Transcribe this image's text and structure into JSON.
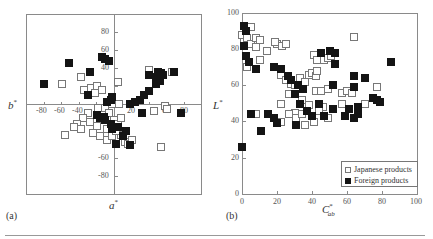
{
  "chart_data": [
    {
      "id": "a",
      "type": "scatter",
      "panel_label": "(a)",
      "title": "",
      "xlabel": "a*",
      "ylabel": "b*",
      "xlim": [
        -100,
        100
      ],
      "ylim": [
        -100,
        100
      ],
      "x_ticks": [
        -80,
        -60,
        -40,
        20,
        60,
        80
      ],
      "y_ticks": [
        80,
        60,
        40,
        -60,
        -80
      ],
      "axes_through_origin": true,
      "grid": false,
      "series": [
        {
          "name": "Japanese products",
          "marker": "open-square",
          "points": [
            [
              -60,
              22
            ],
            [
              -38,
              30
            ],
            [
              -34,
              16
            ],
            [
              -26,
              18
            ],
            [
              -20,
              20
            ],
            [
              -22,
              12
            ],
            [
              -14,
              16
            ],
            [
              4,
              24
            ],
            [
              6,
              0
            ],
            [
              -4,
              2
            ],
            [
              -10,
              -4
            ],
            [
              -18,
              -4
            ],
            [
              -30,
              -10
            ],
            [
              -36,
              -16
            ],
            [
              -42,
              -22
            ],
            [
              -46,
              -26
            ],
            [
              -38,
              -28
            ],
            [
              -28,
              -20
            ],
            [
              -20,
              -24
            ],
            [
              -14,
              -14
            ],
            [
              -6,
              -10
            ],
            [
              0,
              -18
            ],
            [
              4,
              -22
            ],
            [
              8,
              -16
            ],
            [
              -24,
              -32
            ],
            [
              -16,
              -36
            ],
            [
              -8,
              -40
            ],
            [
              -2,
              -36
            ],
            [
              8,
              -34
            ],
            [
              12,
              -42
            ],
            [
              16,
              -44
            ],
            [
              20,
              -40
            ],
            [
              -56,
              -34
            ],
            [
              40,
              38
            ],
            [
              66,
              36
            ],
            [
              46,
              -8
            ],
            [
              58,
              -2
            ],
            [
              60,
              -6
            ],
            [
              54,
              -48
            ],
            [
              -2,
              0
            ],
            [
              -8,
              -28
            ],
            [
              2,
              -30
            ]
          ]
        },
        {
          "name": "Foreign products",
          "marker": "filled-square",
          "points": [
            [
              -80,
              22
            ],
            [
              -52,
              46
            ],
            [
              -28,
              36
            ],
            [
              -30,
              10
            ],
            [
              -14,
              52
            ],
            [
              -10,
              50
            ],
            [
              -6,
              48
            ],
            [
              -4,
              4
            ],
            [
              -8,
              2
            ],
            [
              -2,
              8
            ],
            [
              18,
              0
            ],
            [
              24,
              2
            ],
            [
              30,
              4
            ],
            [
              34,
              10
            ],
            [
              40,
              14
            ],
            [
              40,
              32
            ],
            [
              48,
              30
            ],
            [
              50,
              36
            ],
            [
              54,
              34
            ],
            [
              56,
              32
            ],
            [
              52,
              26
            ],
            [
              48,
              22
            ],
            [
              68,
              36
            ],
            [
              32,
              -10
            ],
            [
              76,
              -10
            ],
            [
              -16,
              -16
            ],
            [
              -10,
              -18
            ],
            [
              -4,
              -22
            ],
            [
              -2,
              -28
            ],
            [
              4,
              -26
            ],
            [
              10,
              -36
            ],
            [
              14,
              -30
            ],
            [
              18,
              -46
            ],
            [
              2,
              -44
            ],
            [
              -12,
              -14
            ],
            [
              -20,
              -12
            ]
          ]
        }
      ]
    },
    {
      "id": "b",
      "type": "scatter",
      "panel_label": "(b)",
      "title": "",
      "xlabel": "C*ab",
      "ylabel": "L*",
      "xlim": [
        0,
        100
      ],
      "ylim": [
        0,
        100
      ],
      "x_ticks": [
        0,
        20,
        40,
        60,
        80,
        100
      ],
      "y_ticks": [
        0,
        20,
        40,
        60,
        80,
        100
      ],
      "grid": false,
      "legend_position": "lower right",
      "series": [
        {
          "name": "Japanese products",
          "marker": "open-square",
          "points": [
            [
              0,
              88
            ],
            [
              1,
              84
            ],
            [
              2,
              90
            ],
            [
              3,
              86
            ],
            [
              5,
              83
            ],
            [
              8,
              86
            ],
            [
              10,
              85
            ],
            [
              8,
              81
            ],
            [
              14,
              79
            ],
            [
              10,
              74
            ],
            [
              3,
              70
            ],
            [
              20,
              83
            ],
            [
              23,
              82
            ],
            [
              25,
              83
            ],
            [
              19,
              84
            ],
            [
              22,
              66
            ],
            [
              25,
              63
            ],
            [
              28,
              61
            ],
            [
              27,
              55
            ],
            [
              30,
              60
            ],
            [
              33,
              64
            ],
            [
              36,
              62
            ],
            [
              38,
              66
            ],
            [
              40,
              67
            ],
            [
              42,
              65
            ],
            [
              43,
              68
            ],
            [
              41,
              77
            ],
            [
              43,
              74
            ],
            [
              47,
              74
            ],
            [
              49,
              75
            ],
            [
              51,
              76
            ],
            [
              42,
              57
            ],
            [
              45,
              57
            ],
            [
              49,
              58
            ],
            [
              57,
              56
            ],
            [
              60,
              57
            ],
            [
              63,
              56
            ],
            [
              64,
              87
            ],
            [
              77,
              59
            ],
            [
              70,
              50
            ],
            [
              57,
              50
            ],
            [
              46,
              48
            ],
            [
              44,
              46
            ],
            [
              38,
              49
            ],
            [
              34,
              52
            ],
            [
              30,
              45
            ],
            [
              27,
              44
            ],
            [
              22,
              50
            ],
            [
              22,
              40
            ],
            [
              31,
              42
            ],
            [
              34,
              44
            ],
            [
              41,
              40
            ],
            [
              49,
              42
            ],
            [
              36,
              38
            ],
            [
              8,
              44
            ],
            [
              5,
              92
            ]
          ]
        },
        {
          "name": "Foreign products",
          "marker": "filled-square",
          "points": [
            [
              1,
              93
            ],
            [
              2,
              90
            ],
            [
              1,
              82
            ],
            [
              2,
              76
            ],
            [
              4,
              73
            ],
            [
              8,
              69
            ],
            [
              18,
              70
            ],
            [
              22,
              69
            ],
            [
              26,
              65
            ],
            [
              28,
              63
            ],
            [
              32,
              60
            ],
            [
              35,
              58
            ],
            [
              30,
              55
            ],
            [
              33,
              50
            ],
            [
              37,
              46
            ],
            [
              40,
              43
            ],
            [
              44,
              50
            ],
            [
              47,
              43
            ],
            [
              50,
              79
            ],
            [
              53,
              78
            ],
            [
              53,
              72
            ],
            [
              45,
              78
            ],
            [
              52,
              60
            ],
            [
              64,
              65
            ],
            [
              70,
              64
            ],
            [
              64,
              59
            ],
            [
              75,
              53
            ],
            [
              77,
              52
            ],
            [
              79,
              51
            ],
            [
              85,
              73
            ],
            [
              52,
              47
            ],
            [
              61,
              47
            ],
            [
              66,
              48
            ],
            [
              59,
              43
            ],
            [
              64,
              42
            ],
            [
              66,
              44
            ],
            [
              31,
              38
            ],
            [
              20,
              39
            ],
            [
              18,
              42
            ],
            [
              15,
              44
            ],
            [
              11,
              35
            ],
            [
              5,
              44
            ],
            [
              0,
              26
            ]
          ]
        }
      ]
    }
  ],
  "legend": {
    "items": [
      {
        "label": "Japanese products",
        "marker": "open-square"
      },
      {
        "label": "Foreign products",
        "marker": "filled-square"
      }
    ]
  },
  "labels": {
    "panel_a": "(a)",
    "panel_b": "(b)",
    "a_xlabel_main": "a",
    "a_xlabel_sup": "*",
    "a_ylabel_main": "b",
    "a_ylabel_sup": "*",
    "b_xlabel_main": "C",
    "b_xlabel_sup": "*",
    "b_xlabel_sub": "ab",
    "b_ylabel_main": "L",
    "b_ylabel_sup": "*"
  },
  "ticks": {
    "a_x": [
      "-80",
      "-60",
      "-40",
      "20",
      "60",
      "80"
    ],
    "a_y": [
      "80",
      "60",
      "40",
      "-60",
      "-80"
    ],
    "b_x": [
      "0",
      "20",
      "40",
      "60",
      "80",
      "100"
    ],
    "b_y": [
      "0",
      "20",
      "40",
      "60",
      "80",
      "100"
    ]
  }
}
